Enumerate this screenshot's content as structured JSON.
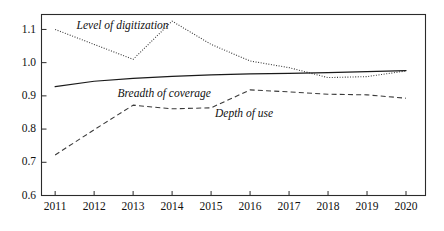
{
  "chart_data": {
    "type": "line",
    "title": "",
    "subtitle": "",
    "xlabel": "",
    "ylabel": "",
    "x": [
      2011,
      2012,
      2013,
      2014,
      2015,
      2016,
      2017,
      2018,
      2019,
      2020
    ],
    "xtick_labels": [
      "2011",
      "2012",
      "2013",
      "2014",
      "2015",
      "2016",
      "2017",
      "2018",
      "2019",
      "2020"
    ],
    "ytick_labels": [
      "0.6",
      "0.7",
      "0.8",
      "0.9",
      "1.0",
      "1.1"
    ],
    "ytick_values": [
      0.6,
      0.7,
      0.8,
      0.9,
      1.0,
      1.1
    ],
    "ylim": [
      0.6,
      1.145
    ],
    "xlim": [
      2010.65,
      2020.5
    ],
    "grid": false,
    "legend": "inline-annotations",
    "series": [
      {
        "name": "Level of digitization",
        "style": "dotted",
        "values": [
          1.1,
          1.055,
          1.01,
          1.125,
          1.055,
          1.005,
          0.985,
          0.955,
          0.958,
          0.975
        ],
        "label_x": 2011.55,
        "label_y": 1.108
      },
      {
        "name": "Breadth of coverage",
        "style": "solid",
        "values": [
          0.928,
          0.944,
          0.953,
          0.959,
          0.963,
          0.966,
          0.968,
          0.97,
          0.973,
          0.976
        ],
        "label_x": 2012.6,
        "label_y": 0.905
      },
      {
        "name": "Depth of use",
        "style": "dashed",
        "values": [
          0.722,
          0.798,
          0.872,
          0.861,
          0.864,
          0.918,
          0.912,
          0.905,
          0.903,
          0.893
        ],
        "label_x": 2015.1,
        "label_y": 0.845
      }
    ],
    "colors": {
      "axis": "#2b2b2b",
      "solid_series": "#1a1a1a",
      "dotted_series": "#3a3a3a",
      "dashed_series": "#3a3a3a",
      "background": "#ffffff"
    }
  }
}
